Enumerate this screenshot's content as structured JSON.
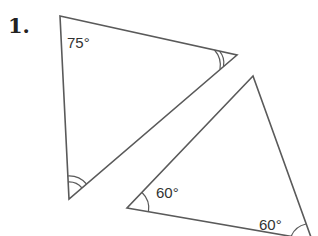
{
  "question": {
    "number": "1."
  },
  "triangles": [
    {
      "name": "triangle-a",
      "vertices": [
        [
          60,
          16
        ],
        [
          237,
          55
        ],
        [
          69,
          199
        ]
      ],
      "angles": [
        {
          "vertex": "top-left",
          "label": "75°",
          "marks": 0
        },
        {
          "vertex": "right",
          "label": "",
          "marks": 2
        },
        {
          "vertex": "bottom",
          "label": "",
          "marks": 2
        }
      ]
    },
    {
      "name": "triangle-b",
      "vertices": [
        [
          253,
          76
        ],
        [
          127,
          208
        ],
        [
          312,
          240
        ]
      ],
      "angles": [
        {
          "vertex": "left",
          "label": "60°",
          "marks": 1
        },
        {
          "vertex": "bottom-right",
          "label": "60°",
          "marks": 1
        },
        {
          "vertex": "top",
          "label": "",
          "marks": 0
        }
      ]
    }
  ],
  "labels": {
    "a_top_left": "75°",
    "b_left": "60°",
    "b_bottom_right": "60°"
  },
  "colors": {
    "line": "#5a5a5a",
    "text": "#333333",
    "background": "#ffffff"
  }
}
